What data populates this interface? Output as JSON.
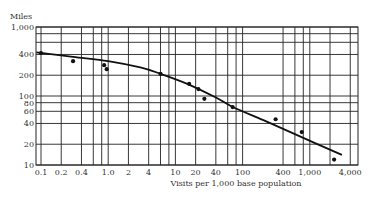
{
  "chart_data": {
    "type": "scatter",
    "title": "",
    "xlabel": "Visits per 1,000 base population",
    "ylabel": "Miles",
    "xscale": "log",
    "yscale": "log",
    "xlim": [
      0.1,
      4000
    ],
    "ylim": [
      10,
      1000
    ],
    "grid": true,
    "x_ticks": [
      0.1,
      0.2,
      0.4,
      1.0,
      2,
      4,
      10,
      20,
      40,
      100,
      400,
      1000,
      4000
    ],
    "x_tick_labels": [
      "0.1",
      "0.2",
      "0.4",
      "1.0",
      "2",
      "4",
      "10",
      "20",
      "40",
      "100",
      "400",
      "1,000",
      "4,000"
    ],
    "x_gridlines": [
      0.1,
      0.2,
      0.4,
      0.6,
      0.8,
      1.0,
      2,
      4,
      6,
      8,
      10,
      20,
      40,
      60,
      80,
      100,
      400,
      600,
      800,
      1000,
      2000,
      4000
    ],
    "y_ticks": [
      10,
      20,
      40,
      60,
      80,
      100,
      200,
      400,
      1000
    ],
    "y_tick_labels": [
      "10",
      "20",
      "40",
      "60",
      "80",
      "100",
      "200",
      "400",
      "1,000"
    ],
    "y_gridlines": [
      10,
      20,
      40,
      60,
      80,
      100,
      200,
      400,
      600,
      800,
      1000
    ],
    "series": [
      {
        "name": "Observed",
        "kind": "points",
        "x": [
          0.1,
          0.3,
          0.87,
          0.95,
          6,
          16,
          22,
          27,
          71,
          310,
          760,
          2300
        ],
        "y": [
          420,
          320,
          280,
          245,
          209,
          150,
          126,
          91,
          69,
          46,
          30,
          12
        ]
      },
      {
        "name": "Fitted curve",
        "kind": "line",
        "x": [
          0.085,
          0.3,
          1,
          3,
          6,
          15,
          40,
          70,
          200,
          600,
          3000
        ],
        "y": [
          430,
          370,
          320,
          260,
          210,
          150,
          95,
          70,
          45,
          28,
          14
        ]
      }
    ]
  }
}
